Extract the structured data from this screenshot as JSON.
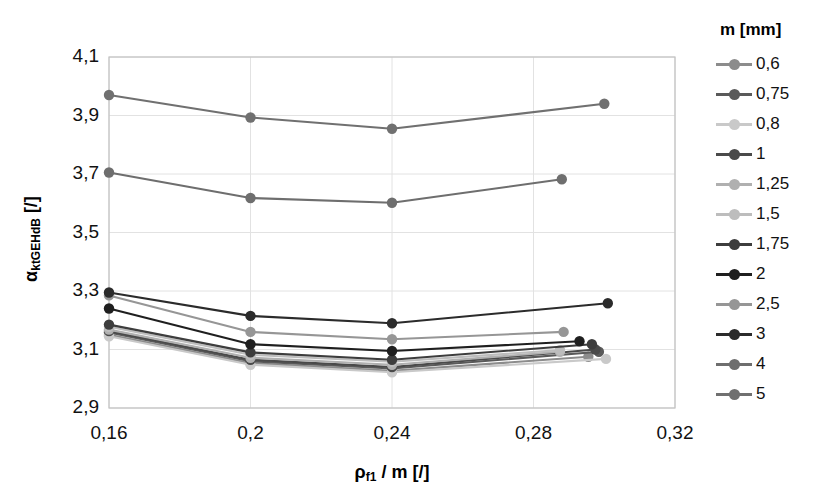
{
  "chart_data": {
    "type": "line",
    "title": "",
    "xlabel": "ρf1 / m [/]",
    "ylabel": "αktGEHdB [/]",
    "xlim": [
      0.16,
      0.32
    ],
    "ylim": [
      2.9,
      4.1
    ],
    "xticks": [
      "0,16",
      "0,2",
      "0,24",
      "0,28",
      "0,32"
    ],
    "xtick_values": [
      0.16,
      0.2,
      0.24,
      0.28,
      0.32
    ],
    "yticks": [
      "2,9",
      "3,1",
      "3,3",
      "3,5",
      "3,7",
      "3,9",
      "4,1"
    ],
    "ytick_values": [
      2.9,
      3.1,
      3.3,
      3.5,
      3.7,
      3.9,
      4.1
    ],
    "grid": true,
    "legend_position": "right",
    "legend_title": "m [mm]",
    "series": [
      {
        "name": "0,6",
        "color": "#8c8c8c",
        "x": [
          0.16,
          0.2,
          0.24,
          0.2955
        ],
        "y": [
          3.15,
          3.053,
          3.027,
          3.075
        ]
      },
      {
        "name": "0,75",
        "color": "#5a5a5a",
        "x": [
          0.16,
          0.2,
          0.24,
          0.2985
        ],
        "y": [
          3.158,
          3.06,
          3.035,
          3.092
        ]
      },
      {
        "name": "0,8",
        "color": "#c9c9c9",
        "x": [
          0.16,
          0.2,
          0.24,
          0.3005
        ],
        "y": [
          3.145,
          3.048,
          3.022,
          3.068
        ]
      },
      {
        "name": "1",
        "color": "#4a4a4a",
        "x": [
          0.16,
          0.2,
          0.24,
          0.2975
        ],
        "y": [
          3.163,
          3.065,
          3.04,
          3.1
        ]
      },
      {
        "name": "1,25",
        "color": "#b0b0b0",
        "x": [
          0.16,
          0.2,
          0.24,
          0.2875
        ],
        "y": [
          3.168,
          3.072,
          3.048,
          3.092
        ]
      },
      {
        "name": "1,5",
        "color": "#bdbdbd",
        "x": [
          0.16,
          0.2,
          0.24,
          0.2875
        ],
        "y": [
          3.178,
          3.082,
          3.058,
          3.098
        ]
      },
      {
        "name": "1,75",
        "color": "#3d3d3d",
        "x": [
          0.16,
          0.2,
          0.24,
          0.2965
        ],
        "y": [
          3.185,
          3.09,
          3.065,
          3.118
        ]
      },
      {
        "name": "2",
        "color": "#1f1f1f",
        "x": [
          0.16,
          0.2,
          0.24,
          0.293
        ],
        "y": [
          3.24,
          3.118,
          3.095,
          3.128
        ]
      },
      {
        "name": "2,5",
        "color": "#969696",
        "x": [
          0.16,
          0.2,
          0.24,
          0.2885
        ],
        "y": [
          3.285,
          3.16,
          3.135,
          3.16
        ]
      },
      {
        "name": "3",
        "color": "#2b2b2b",
        "x": [
          0.16,
          0.2,
          0.24,
          0.301
        ],
        "y": [
          3.295,
          3.215,
          3.19,
          3.258
        ]
      },
      {
        "name": "4",
        "color": "#6e6e6e",
        "x": [
          0.16,
          0.2,
          0.24,
          0.288
        ],
        "y": [
          3.705,
          3.618,
          3.602,
          3.682
        ]
      },
      {
        "name": "5",
        "color": "#707070",
        "x": [
          0.16,
          0.2,
          0.24,
          0.3
        ],
        "y": [
          3.97,
          3.893,
          3.855,
          3.94
        ]
      }
    ]
  },
  "plot": {
    "area": {
      "left": 109,
      "top": 57,
      "right": 675,
      "bottom": 408
    },
    "frame_color": "#c2c2c2",
    "grid_color": "#e2e2e2"
  }
}
